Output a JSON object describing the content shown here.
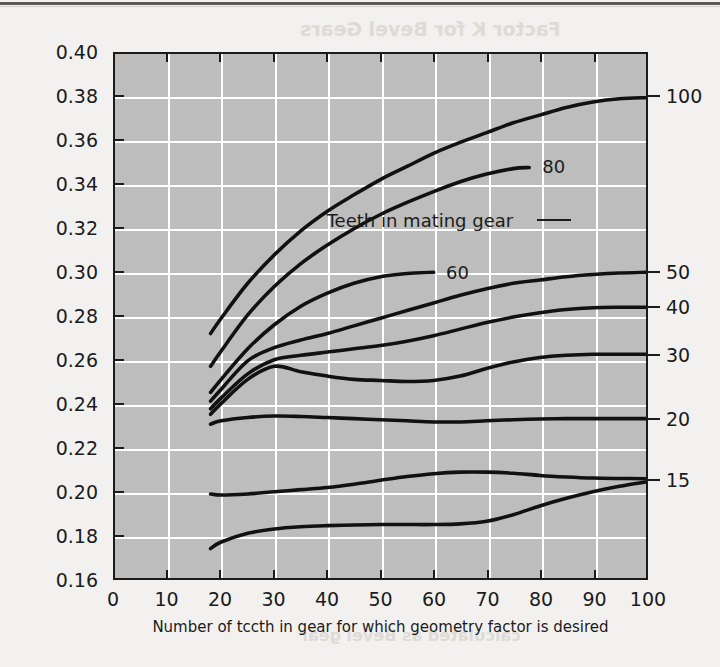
{
  "page": {
    "bleed_text_1": "Factor K  for Bevel Gears",
    "bleed_text_2": "calculated as Bevel gear"
  },
  "chart_data": {
    "type": "line",
    "title": "",
    "xlabel": "Number of tccth in gear for which geometry factor is desired",
    "ylabel": "Geometry factor J",
    "xlim": [
      0,
      100
    ],
    "ylim": [
      0.16,
      0.4
    ],
    "xticks": [
      0,
      10,
      20,
      30,
      40,
      50,
      60,
      70,
      80,
      90,
      100
    ],
    "xtick_labels": [
      "0",
      "10",
      "20",
      "30",
      "40",
      "50",
      "60",
      "70",
      "80",
      "90",
      "100"
    ],
    "yticks": [
      0.16,
      0.18,
      0.2,
      0.22,
      0.24,
      0.26,
      0.28,
      0.3,
      0.32,
      0.34,
      0.36,
      0.38,
      0.4
    ],
    "ytick_labels": [
      "0.16",
      "0.18",
      "0.20",
      "0.22",
      "0.24",
      "0.26",
      "0.28",
      "0.30",
      "0.32",
      "0.34",
      "0.36",
      "0.38",
      "0.40"
    ],
    "grid": true,
    "grid_color": "#ffffff",
    "plot_bg": "#bdbdbd",
    "line_color": "#111111",
    "legend_position": "right-edge-and-inline",
    "legend_note": "Teeth in mating gear",
    "series": [
      {
        "name": "100",
        "label_side": "right",
        "label_value": "100",
        "x": [
          18,
          20,
          25,
          30,
          35,
          40,
          45,
          50,
          55,
          60,
          65,
          70,
          75,
          80,
          85,
          90,
          95,
          100
        ],
        "y": [
          0.272,
          0.279,
          0.295,
          0.308,
          0.319,
          0.328,
          0.3355,
          0.3425,
          0.3485,
          0.3545,
          0.3595,
          0.364,
          0.3685,
          0.372,
          0.3755,
          0.378,
          0.3795,
          0.38
        ]
      },
      {
        "name": "80",
        "label_side": "inline",
        "label_value": "80",
        "x": [
          18,
          20,
          25,
          30,
          35,
          40,
          45,
          50,
          55,
          60,
          65,
          70,
          75,
          78
        ],
        "y": [
          0.257,
          0.264,
          0.2805,
          0.2935,
          0.304,
          0.3125,
          0.32,
          0.3265,
          0.332,
          0.337,
          0.3415,
          0.345,
          0.3475,
          0.348
        ]
      },
      {
        "name": "60",
        "label_side": "inline",
        "label_value": "60",
        "x": [
          18,
          20,
          25,
          30,
          35,
          40,
          45,
          50,
          55,
          60
        ],
        "y": [
          0.245,
          0.251,
          0.265,
          0.276,
          0.2845,
          0.2905,
          0.295,
          0.298,
          0.2995,
          0.3
        ]
      },
      {
        "name": "50",
        "label_side": "right",
        "label_value": "50",
        "x": [
          18,
          20,
          25,
          30,
          35,
          40,
          45,
          50,
          55,
          60,
          65,
          70,
          75,
          80,
          85,
          90,
          95,
          100
        ],
        "y": [
          0.241,
          0.2465,
          0.2595,
          0.2655,
          0.269,
          0.272,
          0.2755,
          0.279,
          0.2825,
          0.286,
          0.2895,
          0.2925,
          0.295,
          0.2965,
          0.298,
          0.299,
          0.2997,
          0.3
        ]
      },
      {
        "name": "40",
        "label_side": "right",
        "label_value": "40",
        "x": [
          18,
          20,
          25,
          30,
          35,
          40,
          45,
          50,
          55,
          60,
          65,
          70,
          75,
          80,
          85,
          90,
          95,
          100
        ],
        "y": [
          0.2375,
          0.2425,
          0.2535,
          0.26,
          0.262,
          0.2635,
          0.265,
          0.2665,
          0.2685,
          0.271,
          0.274,
          0.277,
          0.2795,
          0.2815,
          0.283,
          0.2838,
          0.284,
          0.284
        ]
      },
      {
        "name": "30",
        "label_side": "right",
        "label_value": "30",
        "x": [
          18,
          20,
          25,
          30,
          35,
          40,
          45,
          50,
          55,
          60,
          65,
          70,
          75,
          80,
          85,
          90,
          95,
          100
        ],
        "y": [
          0.235,
          0.24,
          0.251,
          0.257,
          0.2545,
          0.2525,
          0.251,
          0.2505,
          0.25,
          0.2505,
          0.2525,
          0.256,
          0.259,
          0.261,
          0.262,
          0.2625,
          0.2625,
          0.2625
        ]
      },
      {
        "name": "20",
        "label_side": "right",
        "label_value": "20",
        "x": [
          18,
          20,
          25,
          30,
          35,
          40,
          45,
          50,
          55,
          60,
          65,
          70,
          75,
          80,
          85,
          90,
          95,
          100
        ],
        "y": [
          0.2305,
          0.232,
          0.2335,
          0.2342,
          0.234,
          0.2335,
          0.233,
          0.2325,
          0.232,
          0.2315,
          0.2315,
          0.232,
          0.2325,
          0.2328,
          0.233,
          0.233,
          0.233,
          0.233
        ]
      },
      {
        "name": "15",
        "label_side": "right",
        "label_value": "15",
        "x": [
          18,
          20,
          25,
          30,
          35,
          40,
          45,
          50,
          55,
          60,
          65,
          70,
          75,
          80,
          85,
          90,
          95,
          100
        ],
        "y": [
          0.1985,
          0.198,
          0.1985,
          0.1995,
          0.2005,
          0.2015,
          0.203,
          0.2048,
          0.2065,
          0.2078,
          0.2085,
          0.2085,
          0.208,
          0.207,
          0.2063,
          0.2058,
          0.2056,
          0.2055
        ]
      },
      {
        "name": "10",
        "label_side": "none",
        "label_value": "",
        "x": [
          18,
          20,
          25,
          30,
          35,
          40,
          45,
          50,
          55,
          60,
          65,
          70,
          75,
          80,
          85,
          90,
          95,
          100
        ],
        "y": [
          0.1735,
          0.1765,
          0.1805,
          0.1825,
          0.1835,
          0.184,
          0.1843,
          0.1845,
          0.1845,
          0.1845,
          0.1848,
          0.186,
          0.189,
          0.193,
          0.1965,
          0.1995,
          0.202,
          0.204
        ]
      }
    ],
    "inline_annotations": [
      {
        "text": "80",
        "x": 78,
        "y": 0.348
      },
      {
        "text": "60",
        "x": 60,
        "y": 0.3
      },
      {
        "text": "Teeth in mating gear",
        "x": 62,
        "y": 0.3235
      }
    ],
    "right_axis_labels": [
      {
        "text": "100",
        "y": 0.38
      },
      {
        "text": "50",
        "y": 0.3
      },
      {
        "text": "40",
        "y": 0.284
      },
      {
        "text": "30",
        "y": 0.2625
      },
      {
        "text": "20",
        "y": 0.233
      },
      {
        "text": "15",
        "y": 0.2055
      }
    ]
  }
}
